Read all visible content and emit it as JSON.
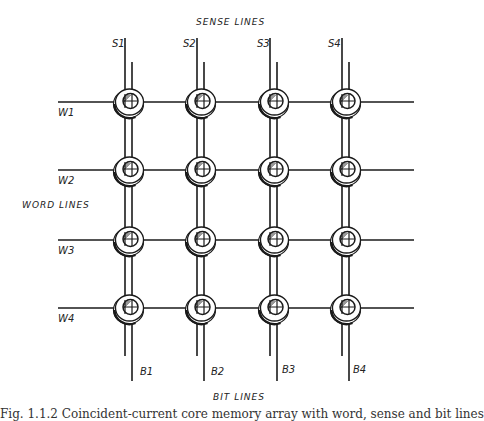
{
  "diagram": {
    "title_top": "SENSE LINES",
    "title_left": "WORD LINES",
    "title_bottom": "BIT LINES",
    "sense_lines": [
      {
        "label": "S1",
        "x": 125
      },
      {
        "label": "S2",
        "x": 197
      },
      {
        "label": "S3",
        "x": 270
      },
      {
        "label": "S4",
        "x": 342
      }
    ],
    "bit_lines": [
      {
        "label": "B1",
        "x": 132
      },
      {
        "label": "B2",
        "x": 204
      },
      {
        "label": "B3",
        "x": 277
      },
      {
        "label": "B4",
        "x": 349
      }
    ],
    "word_lines": [
      {
        "label": "W1",
        "y": 102
      },
      {
        "label": "W2",
        "y": 170
      },
      {
        "label": "W3",
        "y": 240
      },
      {
        "label": "W4",
        "y": 308
      }
    ],
    "core_grid": {
      "rows": 4,
      "cols": 4,
      "core_icon": "ferrite-core-icon"
    },
    "line_color": "#1a1a1a",
    "caption": "Fig. 1.1.2 Coincident-current core memory array with word, sense and bit lines"
  }
}
